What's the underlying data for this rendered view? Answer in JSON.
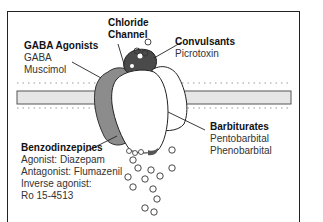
{
  "diagram": {
    "labels": {
      "chloride_channel": {
        "heading": [
          "Chloride",
          "Channel"
        ]
      },
      "gaba_agonists": {
        "heading": "GABA Agonists",
        "items": [
          "GABA",
          "Muscimol"
        ]
      },
      "convulsants": {
        "heading": "Convulsants",
        "items": [
          "Picrotoxin"
        ]
      },
      "barbiturates": {
        "heading": "Barbiturates",
        "items": [
          "Pentobarbital",
          "Phenobarbital"
        ]
      },
      "benzodiazepines": {
        "heading": "Benzodinzepines",
        "items": [
          "Agonist: Diazepam",
          "Antagonist: Flumazenil",
          "Inverse agonist:",
          "Ro 15-4513"
        ]
      }
    },
    "colors": {
      "membrane_fill": "#e6e6e6",
      "gaba_site": "#8c8c8c",
      "channel_site": "#4a4a4a",
      "outline": "#222222"
    }
  }
}
